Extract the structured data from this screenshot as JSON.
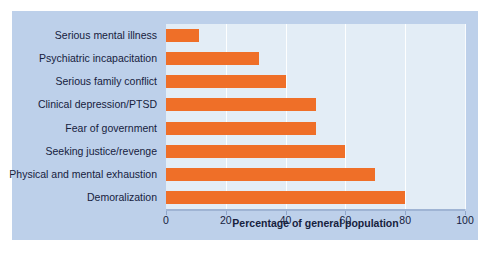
{
  "chart_data": {
    "type": "bar",
    "orientation": "horizontal",
    "title": "",
    "xlabel": "Percentage of general population",
    "ylabel": "",
    "xlim": [
      0,
      100
    ],
    "xticks": [
      "0",
      "20",
      "40",
      "60",
      "80",
      "100"
    ],
    "xtick_values": [
      0,
      20,
      40,
      60,
      80,
      100
    ],
    "grid": true,
    "grid_axis": "x",
    "legend": false,
    "categories": [
      "Serious mental illness",
      "Psychiatric incapacitation",
      "Serious family conflict",
      "Clinical depression/PTSD",
      "Fear of government",
      "Seeking justice/revenge",
      "Physical and mental exhaustion",
      "Demoralization"
    ],
    "values": [
      11,
      31,
      40,
      50,
      50,
      60,
      70,
      80
    ],
    "colors": {
      "bar": "#ef6f28",
      "panel_background": "#bdd0ea",
      "plot_background": "#e3edf6",
      "gridline": "#ffffff",
      "text": "#16213d",
      "axis": "#9fb4d4"
    }
  }
}
